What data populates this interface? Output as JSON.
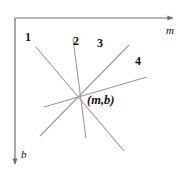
{
  "figure": {
    "background": "#ffffff",
    "width": 189,
    "height": 172,
    "axis_color": "#6f6f6f",
    "line_color": "#9a9a9a",
    "text_color": "#111111"
  },
  "axes": {
    "horizontal": {
      "name": "m-axis",
      "label": "m",
      "label_x": 166,
      "label_y": 25,
      "from_x": 15,
      "from_y": 18,
      "to_x": 173,
      "to_y": 18,
      "arrow": "right"
    },
    "vertical": {
      "name": "b-axis",
      "label": "b",
      "label_x": 21,
      "label_y": 149,
      "from_x": 15,
      "from_y": 18,
      "to_x": 15,
      "to_y": 164,
      "arrow": "down"
    }
  },
  "intersection": {
    "label": "(m,b)",
    "x": 78,
    "y": 96,
    "label_x": 87,
    "label_y": 94
  },
  "lines": [
    {
      "id": "line-1",
      "label": "1",
      "x1": 36,
      "y1": 47,
      "x2": 124,
      "y2": 151,
      "label_x": 25,
      "label_y": 31
    },
    {
      "id": "line-2",
      "label": "2",
      "x1": 73,
      "y1": 39,
      "x2": 86,
      "y2": 138,
      "label_x": 73,
      "label_y": 35
    },
    {
      "id": "line-3",
      "label": "3",
      "x1": 129,
      "y1": 45,
      "x2": 40,
      "y2": 136,
      "label_x": 97,
      "label_y": 37
    },
    {
      "id": "line-4",
      "label": "4",
      "x1": 147,
      "y1": 77,
      "x2": 44,
      "y2": 107,
      "label_x": 135,
      "label_y": 55
    }
  ],
  "chart_data": {
    "type": "scatter",
    "xlabel": "m",
    "ylabel": "b",
    "grid": false,
    "legend": "none",
    "annotations": [
      "1",
      "2",
      "3",
      "4",
      "(m,b)"
    ],
    "note": "Four straight lines all pass through the common point labelled (m,b); the horizontal axis is m increasing to the right and the vertical axis is b increasing downward.",
    "series": [
      {
        "name": "1",
        "x": [
          36,
          124
        ],
        "y": [
          47,
          151
        ]
      },
      {
        "name": "2",
        "x": [
          73,
          86
        ],
        "y": [
          39,
          138
        ]
      },
      {
        "name": "3",
        "x": [
          129,
          40
        ],
        "y": [
          45,
          136
        ]
      },
      {
        "name": "4",
        "x": [
          147,
          44
        ],
        "y": [
          77,
          107
        ]
      }
    ],
    "points": [
      {
        "name": "(m,b)",
        "x": 78,
        "y": 96
      }
    ]
  }
}
